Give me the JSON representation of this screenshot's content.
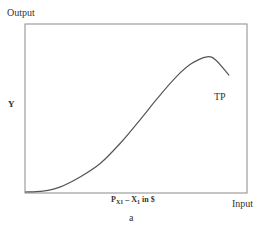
{
  "chart_data": {
    "type": "line",
    "title": "",
    "caption": "a",
    "ylabel": "Output",
    "xlabel": "Input",
    "y_marker": "Y",
    "x_marker": {
      "base": "P",
      "subscript": "X1",
      "rest": " – X",
      "rest_sub": "1",
      "suffix": " in $"
    },
    "series": [
      {
        "name": "TP",
        "x": [
          0.0,
          0.08,
          0.16,
          0.25,
          0.34,
          0.43,
          0.52,
          0.6,
          0.68,
          0.75,
          0.82,
          0.86,
          0.92
        ],
        "values": [
          0.0,
          0.005,
          0.03,
          0.09,
          0.17,
          0.29,
          0.43,
          0.56,
          0.68,
          0.76,
          0.8,
          0.78,
          0.69
        ]
      }
    ],
    "xlim": [
      0,
      1
    ],
    "ylim": [
      0,
      1
    ],
    "grid": false,
    "legend": "none",
    "frame": "full box",
    "annotations": [
      {
        "text": "TP",
        "near": "descending end of curve"
      }
    ]
  },
  "labels": {
    "y_title": "Output",
    "y_mark": "Y",
    "x_title": "Input",
    "x_mark_base": "P",
    "x_mark_sub": "X",
    "x_mark_sub2": "1",
    "x_mark_mid": " – X",
    "x_mark_mid_sub": "1",
    "x_mark_tail": " in $",
    "curve_label": "TP",
    "caption": "a"
  },
  "colors": {
    "axis": "#8a8a8a",
    "curve": "#555555",
    "text": "#333333"
  }
}
